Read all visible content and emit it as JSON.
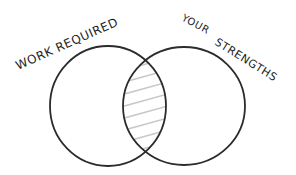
{
  "diagram": {
    "type": "venn",
    "sets": [
      {
        "id": "work",
        "label": "WORK REQUIRED"
      },
      {
        "id": "strengths",
        "label_line1": "YOUR",
        "label_line2": "STRENGTHS"
      }
    ],
    "intersection": {
      "style": "hatched"
    },
    "stroke_color": "#2b2b2b",
    "hatch_color": "#c8c8c8"
  }
}
